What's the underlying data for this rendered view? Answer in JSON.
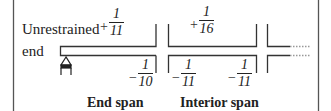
{
  "diagram": {
    "labels": {
      "unrestrained": "Unrestrained",
      "end": "end",
      "end_span": "End span",
      "interior_span": "Interior span"
    },
    "moments": {
      "end_span_positive": {
        "sign": "+",
        "num": "1",
        "den": "11"
      },
      "end_span_negative": {
        "sign": "−",
        "num": "1",
        "den": "10"
      },
      "interior_positive": {
        "sign": "+",
        "num": "1",
        "den": "16"
      },
      "interior_negative_left": {
        "sign": "−",
        "num": "1",
        "den": "11"
      },
      "interior_negative_right": {
        "sign": "−",
        "num": "1",
        "den": "11"
      }
    },
    "colors": {
      "line": "#333333",
      "border": "#555555",
      "dotted": "#999999"
    }
  }
}
